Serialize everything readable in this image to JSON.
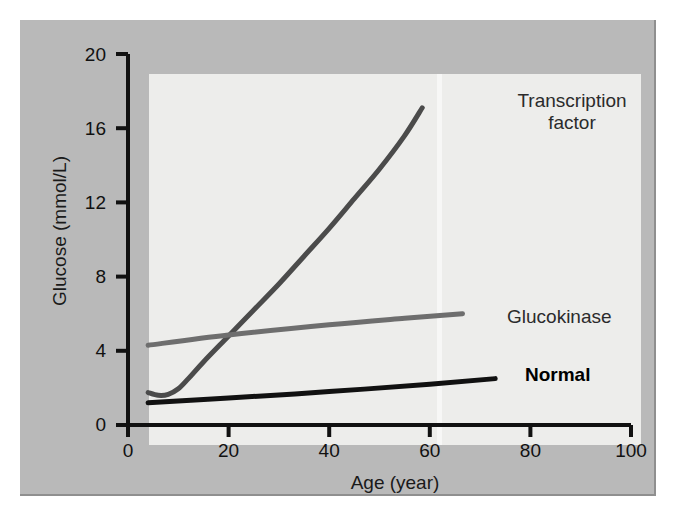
{
  "figure": {
    "background_color": "#b9b9b9",
    "plot_background_color": "#ededeb"
  },
  "chart_data": {
    "type": "line",
    "title": "",
    "xlabel": "Age (year)",
    "ylabel": "Glucose (mmol/L)",
    "xlim": [
      0,
      100
    ],
    "ylim": [
      0,
      20
    ],
    "xticks": [
      "0",
      "20",
      "40",
      "60",
      "80",
      "100"
    ],
    "yticks": [
      "0",
      "4",
      "8",
      "12",
      "16",
      "20"
    ],
    "grid": false,
    "legend_position": "inline-right",
    "series": [
      {
        "name": "Transcription factor",
        "color": "#4b4b4b",
        "linewidth": 5,
        "x": [
          4,
          6,
          8,
          10,
          12,
          15,
          20,
          25,
          30,
          35,
          40,
          45,
          50,
          55,
          58.5
        ],
        "y": [
          1.75,
          1.6,
          1.65,
          1.95,
          2.5,
          3.4,
          4.8,
          6.2,
          7.6,
          9.1,
          10.6,
          12.2,
          13.8,
          15.6,
          17.1
        ]
      },
      {
        "name": "Glucokinase",
        "color": "#6e6e6e",
        "linewidth": 5,
        "x": [
          4,
          20,
          40,
          55,
          66.5
        ],
        "y": [
          4.3,
          4.85,
          5.4,
          5.75,
          6.0
        ]
      },
      {
        "name": "Normal",
        "color": "#111111",
        "linewidth": 5,
        "x": [
          4,
          20,
          40,
          60,
          73
        ],
        "y": [
          1.2,
          1.45,
          1.8,
          2.2,
          2.5
        ]
      }
    ]
  },
  "labels": {
    "transcription_line1": "Transcription",
    "transcription_line2": "factor",
    "glucokinase": "Glucokinase",
    "normal": "Normal"
  }
}
